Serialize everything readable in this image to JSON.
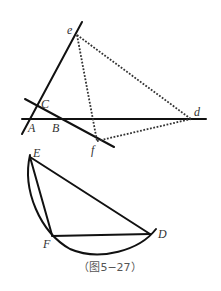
{
  "figure": {
    "caption": "（图5−27）",
    "stroke_color": "#111111",
    "dotted_color": "#333333"
  },
  "upper_figure": {
    "points": {
      "A": {
        "label": "A",
        "x": 30,
        "y": 119
      },
      "B": {
        "label": "B",
        "x": 59,
        "y": 119
      },
      "C": {
        "label": "C",
        "x": 37,
        "y": 106
      },
      "d": {
        "label": "d",
        "x": 191,
        "y": 119
      },
      "e": {
        "label": "e",
        "x": 77,
        "y": 35
      },
      "f": {
        "label": "f",
        "x": 97,
        "y": 141
      }
    },
    "solid_lines": [
      {
        "name": "line-AC-e",
        "from": [
          22,
          134
        ],
        "to": [
          82,
          22
        ]
      },
      {
        "name": "line-AB-d",
        "from": [
          22,
          119
        ],
        "to": [
          206,
          119
        ]
      },
      {
        "name": "line-CB-f",
        "from": [
          25,
          99
        ],
        "to": [
          114,
          147
        ]
      }
    ],
    "dotted_lines": [
      {
        "name": "segment-ed",
        "from": "e",
        "to": "d"
      },
      {
        "name": "segment-ef",
        "from": "e",
        "to": "f"
      },
      {
        "name": "segment-fd",
        "from": "f",
        "to": "d"
      }
    ]
  },
  "lower_figure": {
    "points": {
      "E": {
        "label": "E",
        "x": 30,
        "y": 157
      },
      "F": {
        "label": "F",
        "x": 52,
        "y": 235
      },
      "D": {
        "label": "D",
        "x": 150,
        "y": 234
      }
    },
    "segments": [
      "EF",
      "ED",
      "FD"
    ],
    "arc": {
      "from": "E",
      "to": "D",
      "through": "below F"
    }
  }
}
